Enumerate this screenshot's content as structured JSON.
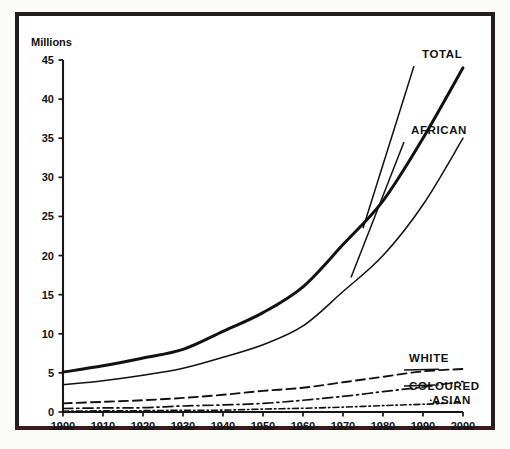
{
  "figure": {
    "axis_title": "Millions",
    "frame_color": "#241d1d"
  },
  "chart_data": {
    "type": "line",
    "title": "",
    "subtitle": "",
    "xlabel": "",
    "ylabel": "Millions",
    "xlim": [
      1900,
      2000
    ],
    "ylim": [
      0,
      45
    ],
    "grid": false,
    "legend_position": "inline-right-labels",
    "x": [
      1900,
      1910,
      1920,
      1930,
      1940,
      1950,
      1960,
      1970,
      1980,
      1990,
      2000
    ],
    "yticks": [
      0,
      5,
      10,
      15,
      20,
      25,
      30,
      35,
      40,
      45
    ],
    "xticks": [
      1900,
      1910,
      1920,
      1930,
      1940,
      1950,
      1960,
      1970,
      1980,
      1990,
      2000
    ],
    "series": [
      {
        "name": "TOTAL",
        "label": "TOTAL",
        "style": "solid-thick",
        "color": "#111111",
        "values": [
          5.1,
          5.9,
          6.9,
          8.0,
          10.3,
          12.7,
          16.0,
          21.4,
          27.0,
          35.0,
          44.0
        ]
      },
      {
        "name": "AFRICAN",
        "label": "AFRICAN",
        "style": "solid-thin",
        "color": "#111111",
        "values": [
          3.5,
          4.0,
          4.7,
          5.6,
          7.0,
          8.6,
          11.0,
          15.4,
          20.0,
          26.5,
          35.0
        ]
      },
      {
        "name": "WHITE",
        "label": "WHITE",
        "style": "dashed",
        "color": "#111111",
        "values": [
          1.1,
          1.3,
          1.5,
          1.8,
          2.2,
          2.7,
          3.1,
          3.8,
          4.5,
          5.2,
          5.5
        ]
      },
      {
        "name": "COLOURED",
        "label": "COLOURED",
        "style": "dash-dot",
        "color": "#111111",
        "values": [
          0.45,
          0.52,
          0.55,
          0.77,
          0.9,
          1.1,
          1.5,
          2.0,
          2.6,
          3.2,
          3.9
        ]
      },
      {
        "name": "ASIAN",
        "label": "ASIAN",
        "style": "dash-dot-dense",
        "color": "#111111",
        "values": [
          0.1,
          0.15,
          0.17,
          0.22,
          0.24,
          0.37,
          0.48,
          0.62,
          0.82,
          0.99,
          1.2
        ]
      }
    ],
    "annotations": [
      {
        "text": "TOTAL",
        "x": 1991,
        "y": 44.5
      },
      {
        "text": "AFRICAN",
        "x": 1982,
        "y": 34.4
      },
      {
        "text": "WHITE",
        "x": 1980,
        "y": 6.6
      },
      {
        "text": "COLOURED",
        "x": 1983,
        "y": 3.6
      },
      {
        "text": "ASIAN",
        "x": 1989,
        "y": 2.0
      }
    ]
  },
  "ticklabels": {
    "y": [
      "0",
      "5",
      "10",
      "15",
      "20",
      "25",
      "30",
      "35",
      "40",
      "45"
    ],
    "x": [
      "1900",
      "1910",
      "1920",
      "1930",
      "1940",
      "1950",
      "1960",
      "1970",
      "1980",
      "1990",
      "2000"
    ]
  },
  "series_labels": {
    "total": "TOTAL",
    "african": "AFRICAN",
    "white": "WHITE",
    "coloured": "COLOURED",
    "asian": "ASIAN"
  }
}
